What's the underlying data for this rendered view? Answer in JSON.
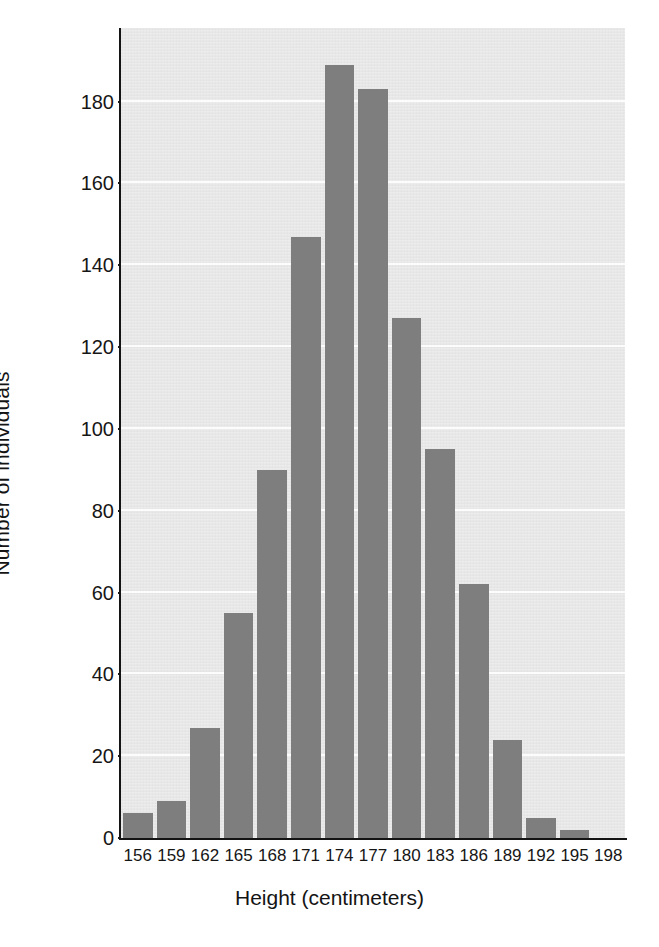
{
  "chart_data": {
    "type": "bar",
    "title": "",
    "subtitle": "",
    "xlabel": "Height (centimeters)",
    "ylabel": "Number of individuals",
    "categories": [
      "156",
      "159",
      "162",
      "165",
      "168",
      "171",
      "174",
      "177",
      "180",
      "183",
      "186",
      "189",
      "192",
      "195",
      "198"
    ],
    "values": [
      6,
      9,
      27,
      55,
      90,
      147,
      189,
      183,
      127,
      95,
      62,
      24,
      5,
      2,
      0
    ],
    "xtick_labels": [
      "156",
      "159",
      "162",
      "165",
      "168",
      "171",
      "174",
      "177",
      "180",
      "183",
      "186",
      "189",
      "192",
      "195",
      "198"
    ],
    "ytick_labels": [
      "0",
      "20",
      "40",
      "60",
      "80",
      "100",
      "120",
      "140",
      "160",
      "180"
    ],
    "ytick_values": [
      0,
      20,
      40,
      60,
      80,
      100,
      120,
      140,
      160,
      180
    ],
    "ylim": [
      0,
      198
    ],
    "xlim": [
      154.5,
      199.5
    ],
    "grid": "horizontal",
    "legend": "none",
    "annotations": [],
    "colors": {
      "bar": "#7e7e7e",
      "plot_background": "#e8e8e8",
      "gridline": "#fcfcfc",
      "axis": "#141414",
      "text": "#161616",
      "figure_background": "#ffffff"
    }
  }
}
